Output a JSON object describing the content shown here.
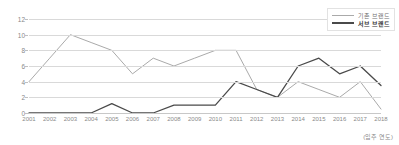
{
  "chart_data": {
    "type": "line",
    "title": "",
    "xlabel": "(입주 연도)",
    "ylabel": "",
    "grid": true,
    "legend_position": "top-right",
    "ylim": [
      0,
      12
    ],
    "yticks": [
      0,
      2,
      4,
      6,
      8,
      10,
      12
    ],
    "categories": [
      "2001",
      "2002",
      "2003",
      "2004",
      "2005",
      "2006",
      "2007",
      "2008",
      "2009",
      "2010",
      "2011",
      "2012",
      "2013",
      "2014",
      "2015",
      "2016",
      "2017",
      "2018"
    ],
    "series": [
      {
        "name": "기존 브랜드",
        "color": "#aaaaaa",
        "values": [
          4,
          7,
          10,
          9,
          8,
          5,
          7,
          6,
          7,
          8,
          8,
          3,
          2,
          4,
          3,
          2,
          4,
          0.5
        ]
      },
      {
        "name": "서브 브랜드",
        "color": "#4a4a4a",
        "values": [
          0,
          0,
          0,
          0,
          1.2,
          0,
          0,
          1,
          1,
          1,
          4,
          3,
          2,
          6,
          7,
          5,
          6,
          3.5
        ]
      }
    ]
  },
  "legend": {
    "items": [
      {
        "label": "기존 브랜드",
        "color": "#aaaaaa"
      },
      {
        "label": "서브 브랜드",
        "color": "#4a4a4a"
      }
    ]
  },
  "axis_note": "(입주 연도)"
}
